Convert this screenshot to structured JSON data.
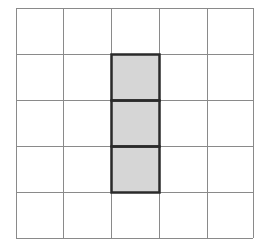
{
  "diagram": {
    "type": "grid",
    "rows": 5,
    "cols": 5,
    "x_lines": [
      16,
      63,
      111,
      159,
      207,
      253
    ],
    "y_lines": [
      8,
      54,
      100,
      146,
      192,
      238
    ],
    "grid_color": "#8a8a8a",
    "shaded_fill": "#d6d6d6",
    "shaded_border": "#2a2a2a",
    "shaded_cells": [
      {
        "row": 1,
        "col": 2
      },
      {
        "row": 2,
        "col": 2
      },
      {
        "row": 3,
        "col": 2
      }
    ]
  }
}
